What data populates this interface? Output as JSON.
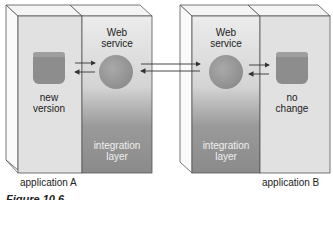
{
  "applications": [
    {
      "label": "application A",
      "component": {
        "line1": "new",
        "line2": "version"
      },
      "service": {
        "line1": "Web",
        "line2": "service"
      },
      "layer": {
        "line1": "integration",
        "line2": "layer"
      }
    },
    {
      "label": "application B",
      "component": {
        "line1": "no",
        "line2": "change"
      },
      "service": {
        "line1": "Web",
        "line2": "service"
      },
      "layer": {
        "line1": "integration",
        "line2": "layer"
      }
    }
  ],
  "caption": "Figure 10.6",
  "colors": {
    "outline": "#555555",
    "component": "#8a8a8a",
    "layer_dark": "#8c8c8c",
    "panel_light": "#e2e2e2"
  }
}
